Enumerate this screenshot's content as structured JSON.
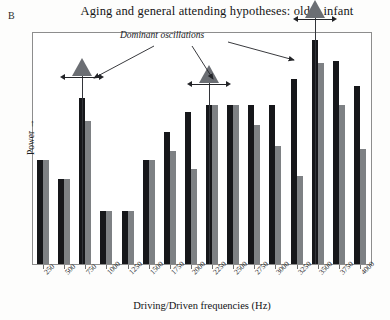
{
  "panel": {
    "label": "B"
  },
  "title": "Aging and general attending hypotheses:  older infant",
  "axes": {
    "y_label": "Power →",
    "x_label": "Driving/Driven frequencies (Hz)"
  },
  "annotation": {
    "text": "Dominant oscillations"
  },
  "markers": [
    {
      "name": "dominant-oscillation-marker-750",
      "category": "750",
      "label": ""
    },
    {
      "name": "dominant-oscillation-marker-2250",
      "category": "2250",
      "label": ""
    },
    {
      "name": "dominant-oscillation-marker-3500",
      "category": "3500",
      "label": ""
    }
  ],
  "colors": {
    "series_dark": "#16171a",
    "series_gray": "#7e8184",
    "marker_fill": "#6b6e73",
    "frame": "#8d8d8d",
    "background": "#ffffff"
  },
  "chart_data": {
    "type": "bar",
    "title": "Aging and general attending hypotheses:  older infant",
    "xlabel": "Driving/Driven frequencies (Hz)",
    "ylabel": "Power →",
    "grid": false,
    "legend": "none",
    "ylim": [
      0,
      100
    ],
    "categories": [
      "250",
      "500",
      "750",
      "1000",
      "1250",
      "1500",
      "1750",
      "2000",
      "2250",
      "2500",
      "2750",
      "3000",
      "3250",
      "3500",
      "3750",
      "4000"
    ],
    "series": [
      {
        "name": "driving",
        "color": "#16171a",
        "values": [
          45,
          37,
          72,
          23,
          23,
          45,
          57,
          66,
          69,
          69,
          69,
          69,
          80,
          97,
          88,
          77
        ]
      },
      {
        "name": "driven",
        "color": "#7e8184",
        "values": [
          45,
          37,
          62,
          23,
          23,
          45,
          49,
          41,
          69,
          69,
          60,
          51,
          38,
          87,
          69,
          50
        ]
      }
    ],
    "annotations": [
      {
        "text": "Dominant oscillations",
        "points_to": [
          "750",
          "2250",
          "3500"
        ]
      }
    ]
  }
}
